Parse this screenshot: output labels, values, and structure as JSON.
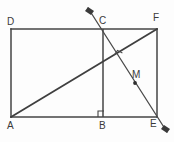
{
  "figure": {
    "background_color": "#fdfdfd",
    "line_color": "#444444",
    "label_color": "#3a3a3a",
    "width": 174,
    "height": 142,
    "labels": {
      "A": "A",
      "B": "B",
      "C": "C",
      "D": "D",
      "E": "E",
      "F": "F",
      "M": "M"
    },
    "points": {
      "A": {
        "x": 11,
        "y": 117
      },
      "B": {
        "x": 103,
        "y": 117
      },
      "C": {
        "x": 103,
        "y": 29
      },
      "D": {
        "x": 11,
        "y": 29
      },
      "E": {
        "x": 157,
        "y": 117
      },
      "F": {
        "x": 157,
        "y": 29
      },
      "M": {
        "x": 135,
        "y": 83
      },
      "intersection": {
        "x": 118,
        "y": 57
      },
      "arrow_top": {
        "x": 88,
        "y": 8
      },
      "arrow_bottom": {
        "x": 167,
        "y": 132
      }
    },
    "label_positions": {
      "A": {
        "x": 8,
        "y": 121
      },
      "B": {
        "x": 99,
        "y": 121
      },
      "C": {
        "x": 99,
        "y": 17
      },
      "D": {
        "x": 7,
        "y": 17
      },
      "E": {
        "x": 150,
        "y": 120
      },
      "F": {
        "x": 153,
        "y": 14
      },
      "M": {
        "x": 133,
        "y": 71
      }
    },
    "segments": [
      {
        "name": "side-AD",
        "from": "A",
        "to": "D"
      },
      {
        "name": "side-DF",
        "from": "D",
        "to": "F"
      },
      {
        "name": "side-FE",
        "from": "F",
        "to": "E"
      },
      {
        "name": "side-AE",
        "from": "A",
        "to": "E"
      },
      {
        "name": "segment-CB",
        "from": "C",
        "to": "B"
      },
      {
        "name": "diagonal-AF",
        "from": "A",
        "to": "F"
      },
      {
        "name": "transversal-CE",
        "from": "arrow_top",
        "to": "arrow_bottom"
      }
    ],
    "right_angle_marks": [
      {
        "name": "right-angle-at-B",
        "x": 103,
        "y": 117
      },
      {
        "name": "right-angle-at-intersection",
        "x": 118,
        "y": 57
      }
    ]
  }
}
